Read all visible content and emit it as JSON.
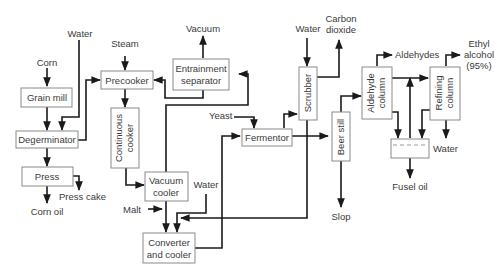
{
  "diagram": {
    "units": {
      "grain_mill": "Grain mill",
      "degerminator": "Degerminator",
      "press": "Press",
      "precooker": "Precooker",
      "continuous_cooker": [
        "Continuous",
        "cooker"
      ],
      "entrainment_separator": [
        "Entrainment",
        "separator"
      ],
      "vacuum_cooler": [
        "Vacuum",
        "cooler"
      ],
      "converter_cooler": [
        "Converter",
        "and cooler"
      ],
      "fermentor": "Fermentor",
      "scrubber": "Scrubber",
      "beer_still": "Beer still",
      "aldehyde_column": [
        "Aldehyde",
        "column"
      ],
      "refining_column": [
        "Refining",
        "column"
      ],
      "decanter": ""
    },
    "streams": {
      "corn": "Corn",
      "water_degerminator": "Water",
      "steam": "Steam",
      "vacuum": "Vacuum",
      "press_cake": "Press cake",
      "corn_oil": "Corn oil",
      "malt": "Malt",
      "water_converter": "Water",
      "yeast": "Yeast",
      "water_scrubber": "Water",
      "carbon_dioxide": [
        "Carbon",
        "dioxide"
      ],
      "slop": "Slop",
      "aldehydes": "Aldehydes",
      "ethyl_alcohol": [
        "Ethyl",
        "alcohol",
        "(95%)"
      ],
      "water_refining": "Water",
      "fusel_oil": "Fusel oil"
    }
  }
}
